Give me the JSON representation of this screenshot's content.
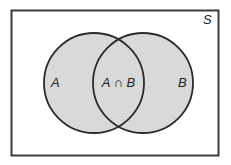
{
  "diagram": {
    "type": "venn",
    "universe": {
      "label": "S"
    },
    "sets": [
      {
        "id": "A",
        "label": "A"
      },
      {
        "id": "B",
        "label": "B"
      }
    ],
    "intersection": {
      "label": "A ∩ B"
    },
    "colors": {
      "fill": "#d9d9d9",
      "stroke": "#2b2b2b",
      "background": "#ffffff"
    }
  }
}
